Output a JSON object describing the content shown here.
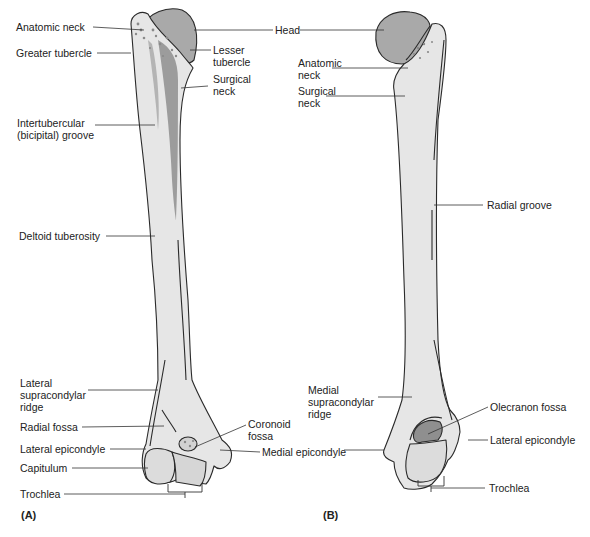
{
  "figure": {
    "colors": {
      "bone_fill": "#e6e6e6",
      "bone_outline": "#2a2a2a",
      "head_fill": "#a9a9a9",
      "shading": "#9c9c9c",
      "leader_line": "#333333",
      "text": "#222222"
    },
    "panels": [
      {
        "id": "A",
        "label": "(A)",
        "labels": {
          "anatomic_neck": "Anatomic neck",
          "greater_tubercle": "Greater tubercle",
          "lesser_tubercle": "Lesser\ntubercle",
          "surgical_neck": "Surgical\nneck",
          "intertubercular_groove": "Intertubercular\n(bicipital) groove",
          "deltoid_tuberosity": "Deltoid tuberosity",
          "lateral_supracondylar_ridge": "Lateral\nsupracondylar\nridge",
          "radial_fossa": "Radial fossa",
          "coronoid_fossa": "Coronoid\nfossa",
          "lateral_epicondyle": "Lateral epicondyle",
          "medial_epicondyle": "Medial epicondyle",
          "capitulum": "Capitulum",
          "trochlea": "Trochlea"
        }
      },
      {
        "id": "B",
        "label": "(B)",
        "labels": {
          "head": "Head",
          "anatomic_neck": "Anatomic\nneck",
          "surgical_neck": "Surgical\nneck",
          "radial_groove": "Radial groove",
          "medial_supracondylar_ridge": "Medial\nsupracondylar\nridge",
          "olecranon_fossa": "Olecranon fossa",
          "lateral_epicondyle": "Lateral epicondyle",
          "trochlea": "Trochlea"
        }
      }
    ]
  }
}
